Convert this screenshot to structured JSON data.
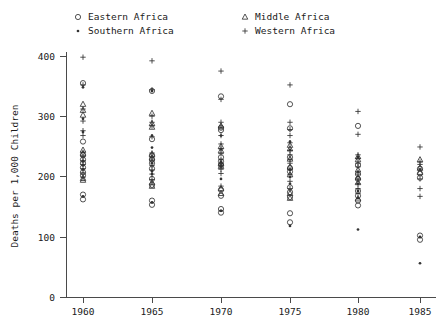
{
  "legend": {
    "entries": [
      {
        "label": "Eastern Africa",
        "marker": "circle-icon",
        "key": "eastern"
      },
      {
        "label": "Middle Africa",
        "marker": "triangle-icon",
        "key": "middle"
      },
      {
        "label": "Southern Africa",
        "marker": "diamond-icon",
        "key": "southern"
      },
      {
        "label": "Western Africa",
        "marker": "plus-icon",
        "key": "western"
      }
    ]
  },
  "axes": {
    "ylabel": "Deaths per 1,000 Children",
    "xlabel": "",
    "yticks": [
      "0",
      "100",
      "200",
      "300",
      "400"
    ],
    "xticks": [
      "1960",
      "1965",
      "1970",
      "1975",
      "1980",
      "1985"
    ]
  },
  "chart_data": {
    "type": "scatter",
    "title": "",
    "xlabel": "",
    "ylabel": "Deaths per 1,000 Children",
    "xlim": [
      1957.5,
      1987.5
    ],
    "ylim": [
      0,
      420
    ],
    "xticks": [
      1960,
      1965,
      1970,
      1975,
      1980,
      1985
    ],
    "yticks": [
      0,
      100,
      200,
      300,
      400
    ],
    "grid": false,
    "legend_position": "top",
    "series": [
      {
        "name": "Eastern Africa",
        "marker": "circle",
        "points": [
          [
            1960,
            355
          ],
          [
            1960,
            258
          ],
          [
            1960,
            236
          ],
          [
            1960,
            228
          ],
          [
            1960,
            222
          ],
          [
            1960,
            215
          ],
          [
            1960,
            207
          ],
          [
            1960,
            202
          ],
          [
            1960,
            170
          ],
          [
            1960,
            162
          ],
          [
            1965,
            342
          ],
          [
            1965,
            262
          ],
          [
            1965,
            235
          ],
          [
            1965,
            228
          ],
          [
            1965,
            222
          ],
          [
            1965,
            213
          ],
          [
            1965,
            196
          ],
          [
            1965,
            186
          ],
          [
            1965,
            160
          ],
          [
            1965,
            153
          ],
          [
            1970,
            333
          ],
          [
            1970,
            281
          ],
          [
            1970,
            277
          ],
          [
            1970,
            232
          ],
          [
            1970,
            225
          ],
          [
            1970,
            219
          ],
          [
            1970,
            178
          ],
          [
            1970,
            168
          ],
          [
            1970,
            146
          ],
          [
            1970,
            140
          ],
          [
            1975,
            320
          ],
          [
            1975,
            280
          ],
          [
            1975,
            232
          ],
          [
            1975,
            214
          ],
          [
            1975,
            208
          ],
          [
            1975,
            182
          ],
          [
            1975,
            174
          ],
          [
            1975,
            166
          ],
          [
            1975,
            139
          ],
          [
            1975,
            124
          ],
          [
            1980,
            284
          ],
          [
            1980,
            219
          ],
          [
            1980,
            204
          ],
          [
            1980,
            196
          ],
          [
            1980,
            176
          ],
          [
            1980,
            168
          ],
          [
            1980,
            160
          ],
          [
            1980,
            152
          ],
          [
            1985,
            213
          ],
          [
            1985,
            205
          ],
          [
            1985,
            198
          ],
          [
            1985,
            102
          ],
          [
            1985,
            95
          ]
        ]
      },
      {
        "name": "Middle Africa",
        "marker": "triangle",
        "points": [
          [
            1960,
            320
          ],
          [
            1960,
            310
          ],
          [
            1960,
            302
          ],
          [
            1960,
            244
          ],
          [
            1960,
            238
          ],
          [
            1960,
            197
          ],
          [
            1960,
            194
          ],
          [
            1965,
            305
          ],
          [
            1965,
            288
          ],
          [
            1965,
            282
          ],
          [
            1965,
            237
          ],
          [
            1965,
            231
          ],
          [
            1965,
            190
          ],
          [
            1965,
            184
          ],
          [
            1970,
            284
          ],
          [
            1970,
            250
          ],
          [
            1970,
            243
          ],
          [
            1970,
            222
          ],
          [
            1970,
            217
          ],
          [
            1970,
            180
          ],
          [
            1970,
            172
          ],
          [
            1975,
            252
          ],
          [
            1975,
            246
          ],
          [
            1975,
            229
          ],
          [
            1975,
            216
          ],
          [
            1975,
            203
          ],
          [
            1975,
            172
          ],
          [
            1975,
            164
          ],
          [
            1980,
            233
          ],
          [
            1980,
            228
          ],
          [
            1980,
            211
          ],
          [
            1980,
            198
          ],
          [
            1980,
            190
          ],
          [
            1980,
            163
          ],
          [
            1985,
            228
          ],
          [
            1985,
            214
          ],
          [
            1985,
            207
          ]
        ]
      },
      {
        "name": "Southern Africa",
        "marker": "diamond",
        "points": [
          [
            1960,
            348
          ],
          [
            1960,
            296
          ],
          [
            1960,
            274
          ],
          [
            1960,
            226
          ],
          [
            1960,
            219
          ],
          [
            1960,
            212
          ],
          [
            1960,
            167
          ],
          [
            1965,
            342
          ],
          [
            1965,
            268
          ],
          [
            1965,
            248
          ],
          [
            1965,
            222
          ],
          [
            1965,
            209
          ],
          [
            1965,
            204
          ],
          [
            1965,
            157
          ],
          [
            1970,
            268
          ],
          [
            1970,
            245
          ],
          [
            1970,
            224
          ],
          [
            1970,
            217
          ],
          [
            1970,
            196
          ],
          [
            1970,
            143
          ],
          [
            1975,
            258
          ],
          [
            1975,
            244
          ],
          [
            1975,
            211
          ],
          [
            1975,
            199
          ],
          [
            1975,
            188
          ],
          [
            1975,
            118
          ],
          [
            1980,
            232
          ],
          [
            1980,
            208
          ],
          [
            1980,
            188
          ],
          [
            1980,
            176
          ],
          [
            1980,
            164
          ],
          [
            1980,
            112
          ],
          [
            1985,
            212
          ],
          [
            1985,
            100
          ],
          [
            1985,
            56
          ]
        ]
      },
      {
        "name": "Western Africa",
        "marker": "plus",
        "points": [
          [
            1960,
            398
          ],
          [
            1960,
            352
          ],
          [
            1960,
            312
          ],
          [
            1960,
            292
          ],
          [
            1960,
            276
          ],
          [
            1960,
            268
          ],
          [
            1960,
            240
          ],
          [
            1960,
            233
          ],
          [
            1960,
            226
          ],
          [
            1960,
            220
          ],
          [
            1960,
            213
          ],
          [
            1960,
            206
          ],
          [
            1960,
            199
          ],
          [
            1965,
            392
          ],
          [
            1965,
            344
          ],
          [
            1965,
            300
          ],
          [
            1965,
            290
          ],
          [
            1965,
            284
          ],
          [
            1965,
            266
          ],
          [
            1965,
            239
          ],
          [
            1965,
            232
          ],
          [
            1965,
            226
          ],
          [
            1965,
            218
          ],
          [
            1965,
            211
          ],
          [
            1965,
            204
          ],
          [
            1965,
            195
          ],
          [
            1970,
            375
          ],
          [
            1970,
            328
          ],
          [
            1970,
            290
          ],
          [
            1970,
            282
          ],
          [
            1970,
            268
          ],
          [
            1970,
            254
          ],
          [
            1970,
            246
          ],
          [
            1970,
            238
          ],
          [
            1970,
            228
          ],
          [
            1970,
            221
          ],
          [
            1970,
            212
          ],
          [
            1970,
            205
          ],
          [
            1970,
            184
          ],
          [
            1975,
            352
          ],
          [
            1975,
            290
          ],
          [
            1975,
            278
          ],
          [
            1975,
            268
          ],
          [
            1975,
            256
          ],
          [
            1975,
            243
          ],
          [
            1975,
            236
          ],
          [
            1975,
            228
          ],
          [
            1975,
            222
          ],
          [
            1975,
            212
          ],
          [
            1975,
            203
          ],
          [
            1975,
            192
          ],
          [
            1975,
            180
          ],
          [
            1980,
            308
          ],
          [
            1980,
            270
          ],
          [
            1980,
            236
          ],
          [
            1980,
            230
          ],
          [
            1980,
            222
          ],
          [
            1980,
            216
          ],
          [
            1980,
            204
          ],
          [
            1980,
            196
          ],
          [
            1980,
            188
          ],
          [
            1980,
            180
          ],
          [
            1980,
            172
          ],
          [
            1985,
            249
          ],
          [
            1985,
            224
          ],
          [
            1985,
            220
          ],
          [
            1985,
            196
          ],
          [
            1985,
            180
          ],
          [
            1985,
            167
          ]
        ]
      }
    ]
  }
}
